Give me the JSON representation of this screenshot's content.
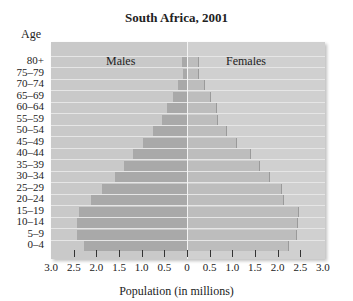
{
  "chart_data": {
    "type": "bar",
    "subtype": "population_pyramid",
    "title": "South Africa, 2001",
    "ylabel": "Age",
    "xlabel": "Population (in millions)",
    "x_ticks_left": [
      "3.0",
      "2.5",
      "2.0",
      "1.5",
      "1.0",
      "0.5",
      "0"
    ],
    "x_ticks_right": [
      "0.5",
      "1.0",
      "1.5",
      "2.0",
      "2.5",
      "3.0"
    ],
    "xlim": [
      -3.0,
      3.0
    ],
    "categories": [
      "80+",
      "75–79",
      "70–74",
      "65–69",
      "60–64",
      "55–59",
      "50–54",
      "45–49",
      "40–44",
      "35–39",
      "30–34",
      "25–29",
      "20–24",
      "15–19",
      "10–14",
      "5–9",
      "0–4"
    ],
    "series": [
      {
        "name": "Males",
        "values": [
          0.11,
          0.09,
          0.2,
          0.31,
          0.44,
          0.55,
          0.76,
          0.98,
          1.2,
          1.38,
          1.6,
          1.87,
          2.13,
          2.38,
          2.42,
          2.42,
          2.27
        ]
      },
      {
        "name": "Females",
        "values": [
          0.24,
          0.24,
          0.37,
          0.51,
          0.64,
          0.67,
          0.87,
          1.09,
          1.4,
          1.58,
          1.82,
          2.07,
          2.11,
          2.44,
          2.42,
          2.4,
          2.24
        ]
      }
    ],
    "grid": false,
    "legend": "inline labels: Males (left), Females (right)"
  },
  "labels": {
    "title": "South Africa, 2001",
    "age": "Age",
    "males": "Males",
    "females": "Females",
    "xaxis": "Population (in millions)"
  }
}
